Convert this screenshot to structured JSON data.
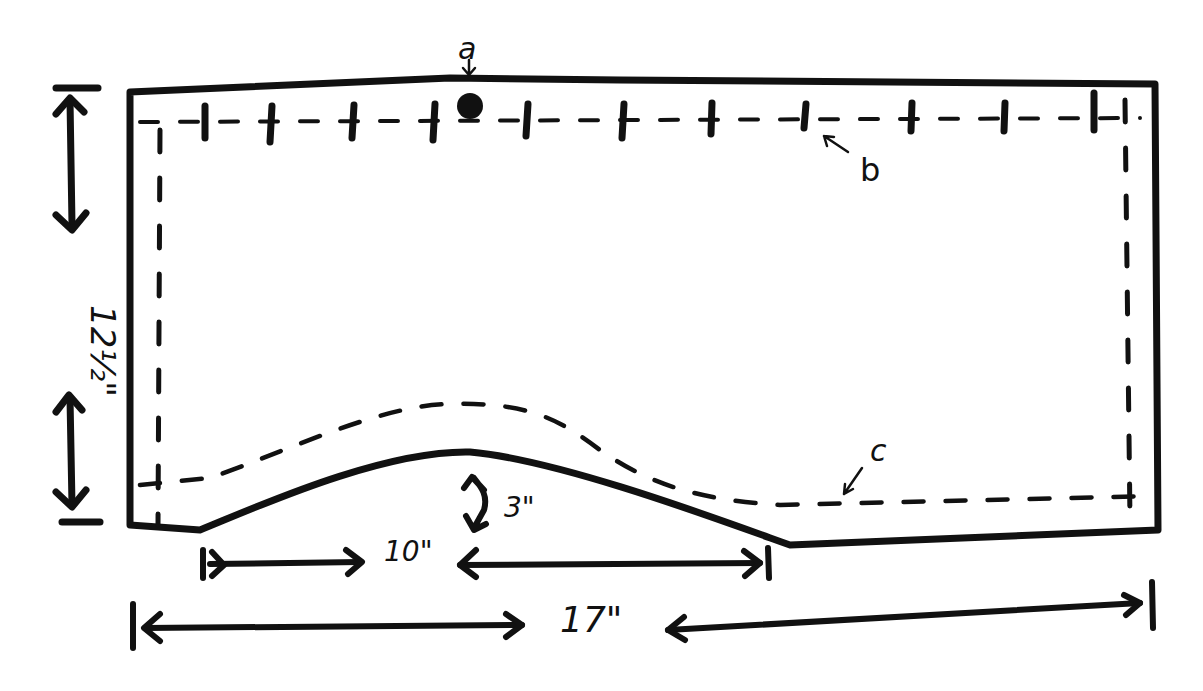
{
  "diagram": {
    "title": "",
    "type": "sewing pattern piece (hand-drawn)",
    "labels": {
      "a": "a",
      "b": "b",
      "c": "c"
    },
    "dimensions": {
      "height": "12½\"",
      "total_width": "17\"",
      "curve_span": "10\"",
      "curve_rise": "3\""
    },
    "annotations": [
      {
        "id": "a",
        "text": "a",
        "points_to": "dot at top edge"
      },
      {
        "id": "b",
        "text": "b",
        "points_to": "top stitch line with tick marks"
      },
      {
        "id": "c",
        "text": "c",
        "points_to": "dashed seam line along curved bottom"
      }
    ],
    "colors": {
      "ink": "#111111",
      "paper": "#ffffff"
    }
  }
}
